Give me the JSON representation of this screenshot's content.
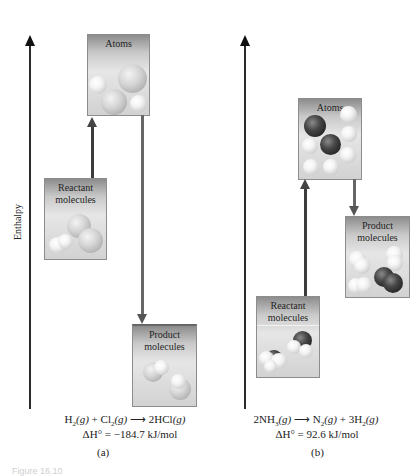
{
  "figure": {
    "y_axis_label": "Enthalpy",
    "caption_fragment": "Figure 16.10"
  },
  "panels": [
    {
      "id": "a",
      "label": "(a)",
      "boxes": {
        "atoms": "Atoms",
        "reactant": "Reactant molecules",
        "product": "Product molecules"
      },
      "equation": {
        "r1": "H",
        "r1_sub": "2",
        "r1_state": "(g)",
        "plus": "+",
        "r2": "Cl",
        "r2_sub": "2",
        "r2_state": "(g)",
        "arrow": "⟶",
        "p1": "2HCl",
        "p1_state": "(g)"
      },
      "delta_h": "ΔH° = −184.7 kJ/mol"
    },
    {
      "id": "b",
      "label": "(b)",
      "boxes": {
        "atoms": "Atoms",
        "reactant": "Reactant molecules",
        "product": "Product molecules"
      },
      "equation": {
        "r1": "2NH",
        "r1_sub": "3",
        "r1_state": "(g)",
        "arrow": "⟶",
        "p1": "N",
        "p1_sub": "2",
        "p1_state": "(g)",
        "plus": "+",
        "p2": "3H",
        "p2_sub": "2",
        "p2_state": "(g)"
      },
      "delta_h": "ΔH° = 92.6 kJ/mol"
    }
  ]
}
